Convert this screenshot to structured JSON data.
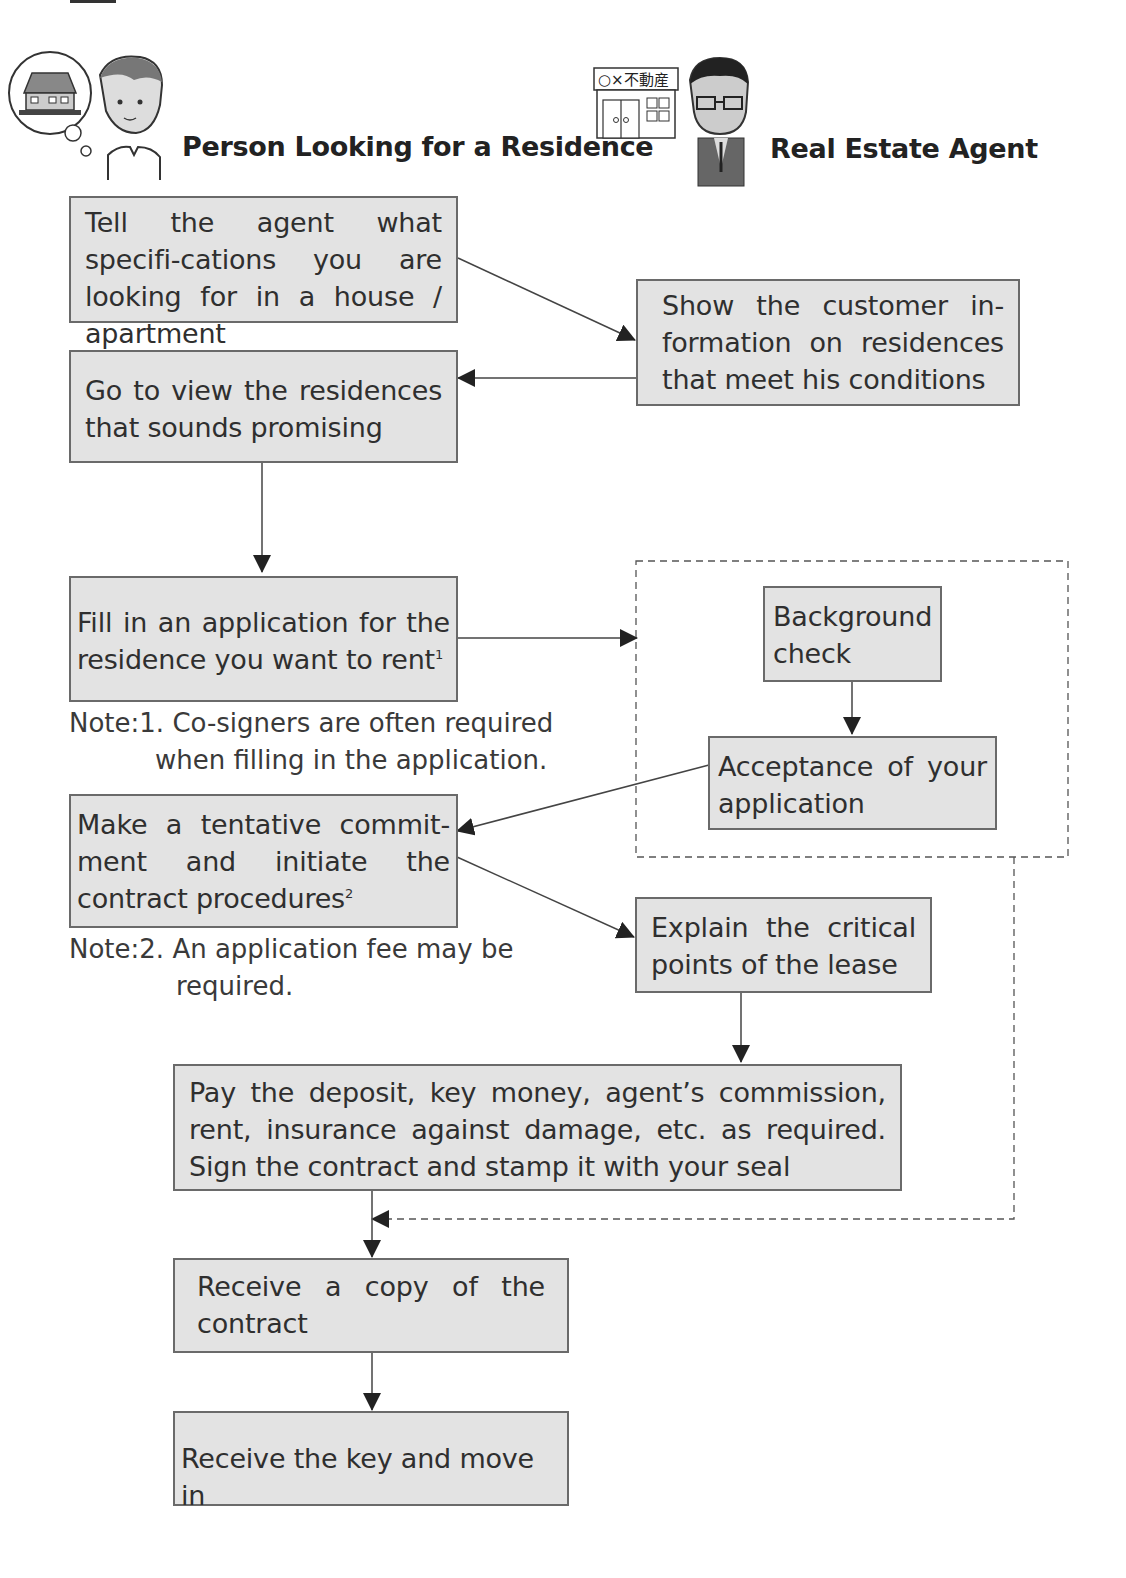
{
  "lanes": {
    "left": {
      "title": "Person Looking for a Residence",
      "icon": "person-thinking-of-house-icon"
    },
    "right": {
      "title": "Real Estate Agent",
      "icon": "real-estate-agent-icon",
      "shop_sign": "○×不動産"
    }
  },
  "steps": {
    "tell_agent": "Tell the agent what specifi-cations you are looking for in a house / apartment",
    "show_info": "Show the customer in-formation on residences that meet his conditions",
    "go_view": "Go to view the residences that sounds promising",
    "fill_application": "Fill in an application for the residence you want to rent",
    "fill_application_sup": "1",
    "background_check": "Background check",
    "acceptance": "Acceptance of your application",
    "tentative_commitment": "Make a tentative commit-ment and initiate the contract procedures",
    "tentative_commitment_sup": "2",
    "explain_lease": "Explain the critical points of the lease",
    "pay_deposit": "Pay the deposit, key money, agent’s commission, rent, insurance against damage, etc. as required. Sign the contract and stamp it with your seal",
    "receive_copy": "Receive a copy of the contract",
    "receive_key": "Receive the key and move in"
  },
  "notes": {
    "note1_line1": "Note:1. Co-signers are often required",
    "note1_line2": "when filling in the application.",
    "note2_line1": "Note:2. An application fee may be",
    "note2_line2": "required."
  },
  "colors": {
    "box_fill": "#e3e3e3",
    "box_border": "#6a6a6a",
    "arrow": "#333333",
    "dashed": "#555555"
  }
}
